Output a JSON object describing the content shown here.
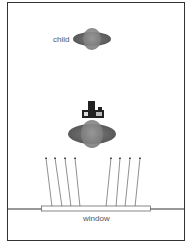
{
  "diagram": {
    "type": "top-down scene diagram",
    "labels": {
      "child": "child",
      "window": "window"
    },
    "elements": [
      {
        "name": "child-figure",
        "label": "child",
        "shape": "top-down person (ellipse body with round head)"
      },
      {
        "name": "camera",
        "shape": "camera icon held above adult"
      },
      {
        "name": "adult-figure",
        "shape": "top-down person (ellipse body with round head)"
      },
      {
        "name": "light-rays-left",
        "count": 4,
        "direction": "up from window"
      },
      {
        "name": "light-rays-right",
        "count": 4,
        "direction": "up from window"
      },
      {
        "name": "window",
        "label": "window",
        "shape": "horizontal bar on wall line"
      }
    ],
    "colors": {
      "frame": "#333333",
      "figure_outer": "#666666",
      "figure_inner": "#8a8a8a",
      "camera": "#222222",
      "ray": "#444444",
      "window_fill": "#ffffff"
    }
  }
}
